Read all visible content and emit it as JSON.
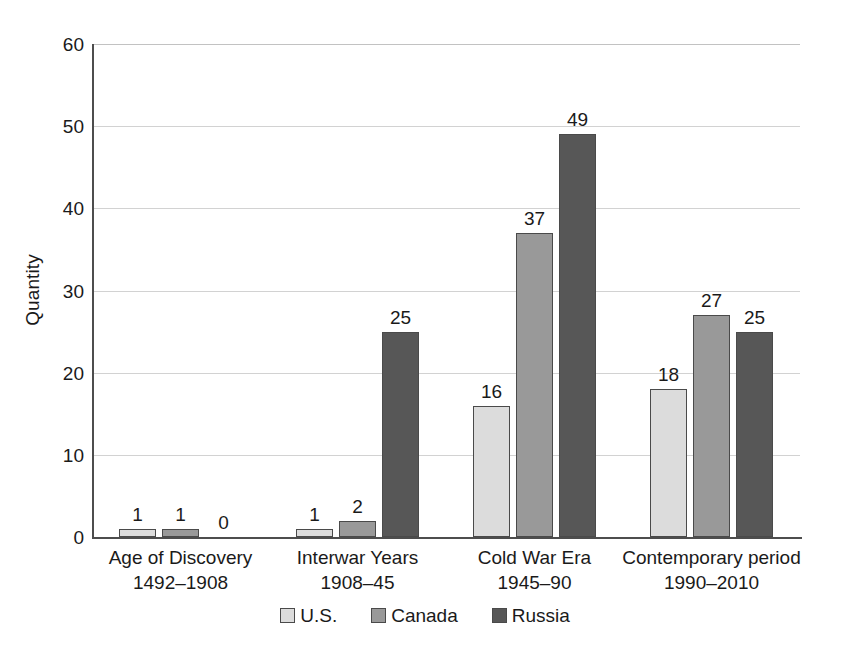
{
  "chart_data": {
    "type": "bar",
    "title": "",
    "subtitle": "",
    "xlabel": "",
    "ylabel": "Quantity",
    "ylim": [
      0,
      60
    ],
    "ytick_values": [
      0,
      10,
      20,
      30,
      40,
      50,
      60
    ],
    "ytick_labels": [
      "0",
      "10",
      "20",
      "30",
      "40",
      "50",
      "60"
    ],
    "grid": true,
    "legend_position": "bottom",
    "categories": [
      "Age of Discovery 1492–1908",
      "Interwar Years 1908–45",
      "Cold War Era 1945–90",
      "Contemporary period 1990–2010"
    ],
    "category_lines": [
      {
        "line1": "Age of Discovery",
        "line2": "1492–1908"
      },
      {
        "line1": "Interwar Years",
        "line2": "1908–45"
      },
      {
        "line1": "Cold War Era",
        "line2": "1945–90"
      },
      {
        "line1": "Contemporary period",
        "line2": "1990–2010"
      }
    ],
    "series": [
      {
        "name": "U.S.",
        "color": "#dcdcdc",
        "values": [
          1,
          1,
          16,
          18
        ]
      },
      {
        "name": "Canada",
        "color": "#999999",
        "values": [
          1,
          2,
          37,
          27
        ]
      },
      {
        "name": "Russia",
        "color": "#575757",
        "values": [
          0,
          25,
          49,
          25
        ]
      }
    ],
    "data_labels": [
      [
        "1",
        "1",
        "0"
      ],
      [
        "1",
        "2",
        "25"
      ],
      [
        "16",
        "37",
        "49"
      ],
      [
        "18",
        "27",
        "25"
      ]
    ]
  },
  "legend": {
    "items": [
      {
        "label": "U.S.",
        "color": "#dcdcdc"
      },
      {
        "label": "Canada",
        "color": "#999999"
      },
      {
        "label": "Russia",
        "color": "#575757"
      }
    ]
  },
  "axis": {
    "y_title": "Quantity"
  }
}
